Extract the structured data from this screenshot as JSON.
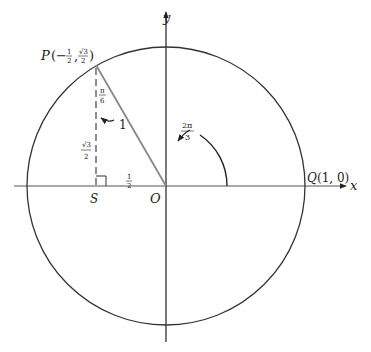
{
  "diagram": {
    "axes": {
      "x_label": "x",
      "y_label": "y"
    },
    "origin_label": "O",
    "point_p": {
      "label": "P",
      "coords_text": "(−½, √3/2)",
      "x_num": "1",
      "x_den": "2",
      "y_num": "√3",
      "y_den": "2"
    },
    "point_q": {
      "label": "Q",
      "coords_text": "(1, 0)"
    },
    "foot_label": "S",
    "segment_labels": {
      "hypotenuse": "1",
      "horizontal": {
        "num": "1",
        "den": "2"
      },
      "vertical": {
        "num": "√3",
        "den": "2"
      }
    },
    "angles": {
      "main": {
        "num": "2π",
        "den": "3"
      },
      "at_p": {
        "num": "π",
        "den": "6"
      }
    },
    "colors": {
      "line": "#222222",
      "radius": "#888888",
      "dashed": "#444444"
    }
  }
}
